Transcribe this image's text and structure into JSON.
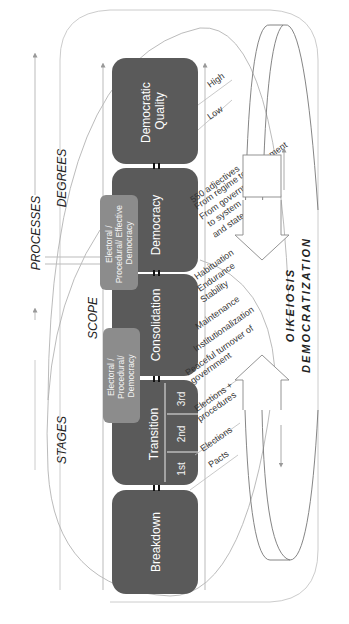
{
  "diagram": {
    "orientation": "rotated-90-ccw",
    "colors": {
      "stage_box": "#5a5a5a",
      "sub_box": "#8c8c8c",
      "lines": "#aaaaaa",
      "text_dark": "#333333"
    },
    "stages": [
      {
        "id": "breakdown",
        "label": "Breakdown"
      },
      {
        "id": "transition",
        "label": "Transition"
      },
      {
        "id": "consolidation",
        "label": "Consolidation"
      },
      {
        "id": "democracy",
        "label": "Democracy"
      },
      {
        "id": "quality",
        "label": "Democratic",
        "label2": "Quality"
      }
    ],
    "transition_phases": [
      "1st",
      "2nd",
      "3rd"
    ],
    "sub_boxes": [
      {
        "line1": "Electoral /",
        "line2": "Procedural/",
        "line3": "Democracy"
      },
      {
        "line1": "Electoral /",
        "line2": "Procedural/ Effective",
        "line3": "Democracy"
      }
    ],
    "axis_labels": {
      "stages": "STAGES",
      "scope": "SCOPE",
      "processes": "PROCESSES",
      "degrees": "DEGREES"
    },
    "annotations": {
      "pacts": "Pacts",
      "elections": "Elections",
      "elections_procedures_1": "Elections +",
      "elections_procedures_2": "procedures",
      "peaceful_1": "Peaceful turnover of",
      "peaceful_2": "government",
      "institutionalization": "Institutionalization",
      "maintenance": "Maintenance",
      "stability": "Stability",
      "endurance": "Endurance",
      "habituation": "Habituation",
      "adjectives": "550 adjectives",
      "regime_gov": "From regime to government",
      "gov_system_1": "From government",
      "gov_system_2": "to system",
      "gov_system_3": "and state",
      "low": "Low",
      "high": "High"
    },
    "right_labels": {
      "oikeiosis": "OIKEIOSIS",
      "democratization": "DEMOCRATIZATION"
    }
  }
}
